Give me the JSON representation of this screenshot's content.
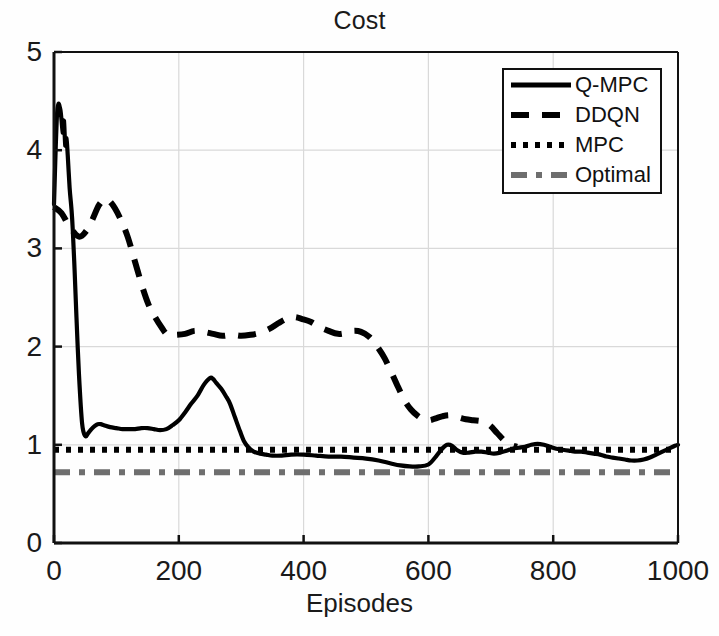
{
  "chart_data": {
    "type": "line",
    "title": "Cost",
    "xlabel": "Episodes",
    "ylabel": "",
    "xlim": [
      0,
      1000
    ],
    "ylim": [
      0,
      5
    ],
    "xticks": [
      0,
      200,
      400,
      600,
      800,
      1000
    ],
    "yticks": [
      0,
      1,
      2,
      3,
      4,
      5
    ],
    "grid": true,
    "legend_position": "upper right",
    "series": [
      {
        "name": "Q-MPC",
        "style": "solid",
        "color": "#000000",
        "x": [
          0,
          5,
          10,
          14,
          16,
          18,
          20,
          22,
          25,
          28,
          30,
          33,
          36,
          40,
          45,
          50,
          55,
          60,
          65,
          70,
          75,
          80,
          90,
          100,
          110,
          120,
          130,
          140,
          150,
          160,
          170,
          180,
          190,
          200,
          210,
          220,
          230,
          240,
          250,
          255,
          260,
          268,
          275,
          282,
          290,
          298,
          305,
          312,
          320,
          330,
          340,
          350,
          365,
          380,
          400,
          420,
          440,
          460,
          480,
          500,
          520,
          540,
          555,
          570,
          585,
          600,
          612,
          622,
          630,
          638,
          645,
          655,
          665,
          675,
          685,
          695,
          705,
          715,
          725,
          735,
          745,
          755,
          765,
          775,
          785,
          795,
          805,
          815,
          825,
          835,
          845,
          855,
          865,
          875,
          885,
          895,
          905,
          915,
          925,
          935,
          945,
          955,
          965,
          975,
          985,
          995,
          1000
        ],
        "y": [
          3.45,
          4.38,
          4.42,
          4.18,
          4.3,
          4.05,
          4.12,
          3.95,
          3.62,
          3.4,
          3.2,
          2.78,
          2.3,
          1.72,
          1.22,
          1.09,
          1.12,
          1.16,
          1.19,
          1.21,
          1.21,
          1.2,
          1.18,
          1.17,
          1.16,
          1.16,
          1.16,
          1.17,
          1.17,
          1.16,
          1.15,
          1.16,
          1.2,
          1.25,
          1.33,
          1.42,
          1.5,
          1.61,
          1.68,
          1.67,
          1.63,
          1.57,
          1.5,
          1.42,
          1.28,
          1.14,
          1.03,
          0.97,
          0.93,
          0.91,
          0.9,
          0.89,
          0.89,
          0.9,
          0.9,
          0.89,
          0.88,
          0.88,
          0.87,
          0.86,
          0.84,
          0.81,
          0.79,
          0.78,
          0.78,
          0.8,
          0.88,
          0.96,
          1.0,
          0.99,
          0.95,
          0.92,
          0.92,
          0.93,
          0.93,
          0.92,
          0.91,
          0.92,
          0.94,
          0.96,
          0.97,
          0.98,
          1.0,
          1.01,
          1.0,
          0.98,
          0.96,
          0.95,
          0.94,
          0.93,
          0.93,
          0.92,
          0.91,
          0.9,
          0.88,
          0.87,
          0.86,
          0.85,
          0.84,
          0.84,
          0.85,
          0.87,
          0.9,
          0.93,
          0.96,
          0.99,
          1.0
        ]
      },
      {
        "name": "DDQN",
        "style": "dashed",
        "color": "#000000",
        "x": [
          0,
          12,
          25,
          40,
          52,
          62,
          72,
          82,
          92,
          105,
          118,
          130,
          142,
          152,
          162,
          172,
          182,
          195,
          210,
          225,
          240,
          255,
          270,
          285,
          300,
          315,
          330,
          345,
          360,
          372,
          385,
          398,
          412,
          425,
          440,
          455,
          468,
          480,
          492,
          505,
          518,
          530,
          542,
          552,
          562,
          572,
          582,
          592,
          602,
          612,
          622,
          635,
          648,
          660,
          672,
          685,
          698,
          710,
          722,
          732,
          742
        ],
        "y": [
          3.42,
          3.36,
          3.22,
          3.12,
          3.18,
          3.3,
          3.44,
          3.5,
          3.46,
          3.32,
          3.12,
          2.86,
          2.6,
          2.42,
          2.3,
          2.2,
          2.12,
          2.12,
          2.13,
          2.16,
          2.15,
          2.13,
          2.11,
          2.12,
          2.11,
          2.12,
          2.14,
          2.18,
          2.24,
          2.28,
          2.3,
          2.28,
          2.25,
          2.2,
          2.16,
          2.13,
          2.14,
          2.16,
          2.15,
          2.1,
          2.0,
          1.88,
          1.72,
          1.58,
          1.45,
          1.36,
          1.3,
          1.26,
          1.25,
          1.27,
          1.29,
          1.3,
          1.28,
          1.26,
          1.25,
          1.24,
          1.2,
          1.12,
          1.04,
          1.0,
          0.98
        ]
      },
      {
        "name": "MPC",
        "style": "dotted",
        "color": "#000000",
        "constant": 0.95
      },
      {
        "name": "Optimal",
        "style": "dashdot",
        "color": "#6e6e6e",
        "constant": 0.72
      }
    ]
  },
  "legend": {
    "entries": [
      {
        "label": "Q-MPC",
        "style": "solid",
        "color": "#000000"
      },
      {
        "label": "DDQN",
        "style": "dashed",
        "color": "#000000"
      },
      {
        "label": "MPC",
        "style": "dotted",
        "color": "#000000"
      },
      {
        "label": "Optimal",
        "style": "dashdot",
        "color": "#6e6e6e"
      }
    ]
  },
  "axes": {
    "title": "Cost",
    "xlabel": "Episodes",
    "xtick_labels": [
      "0",
      "200",
      "400",
      "600",
      "800",
      "1000"
    ],
    "ytick_labels": [
      "0",
      "1",
      "2",
      "3",
      "4",
      "5"
    ]
  },
  "colors": {
    "axis": "#111111",
    "grid": "#d9d9d9",
    "series_primary": "#000000",
    "series_optimal": "#6e6e6e",
    "background": "#fefefe"
  }
}
